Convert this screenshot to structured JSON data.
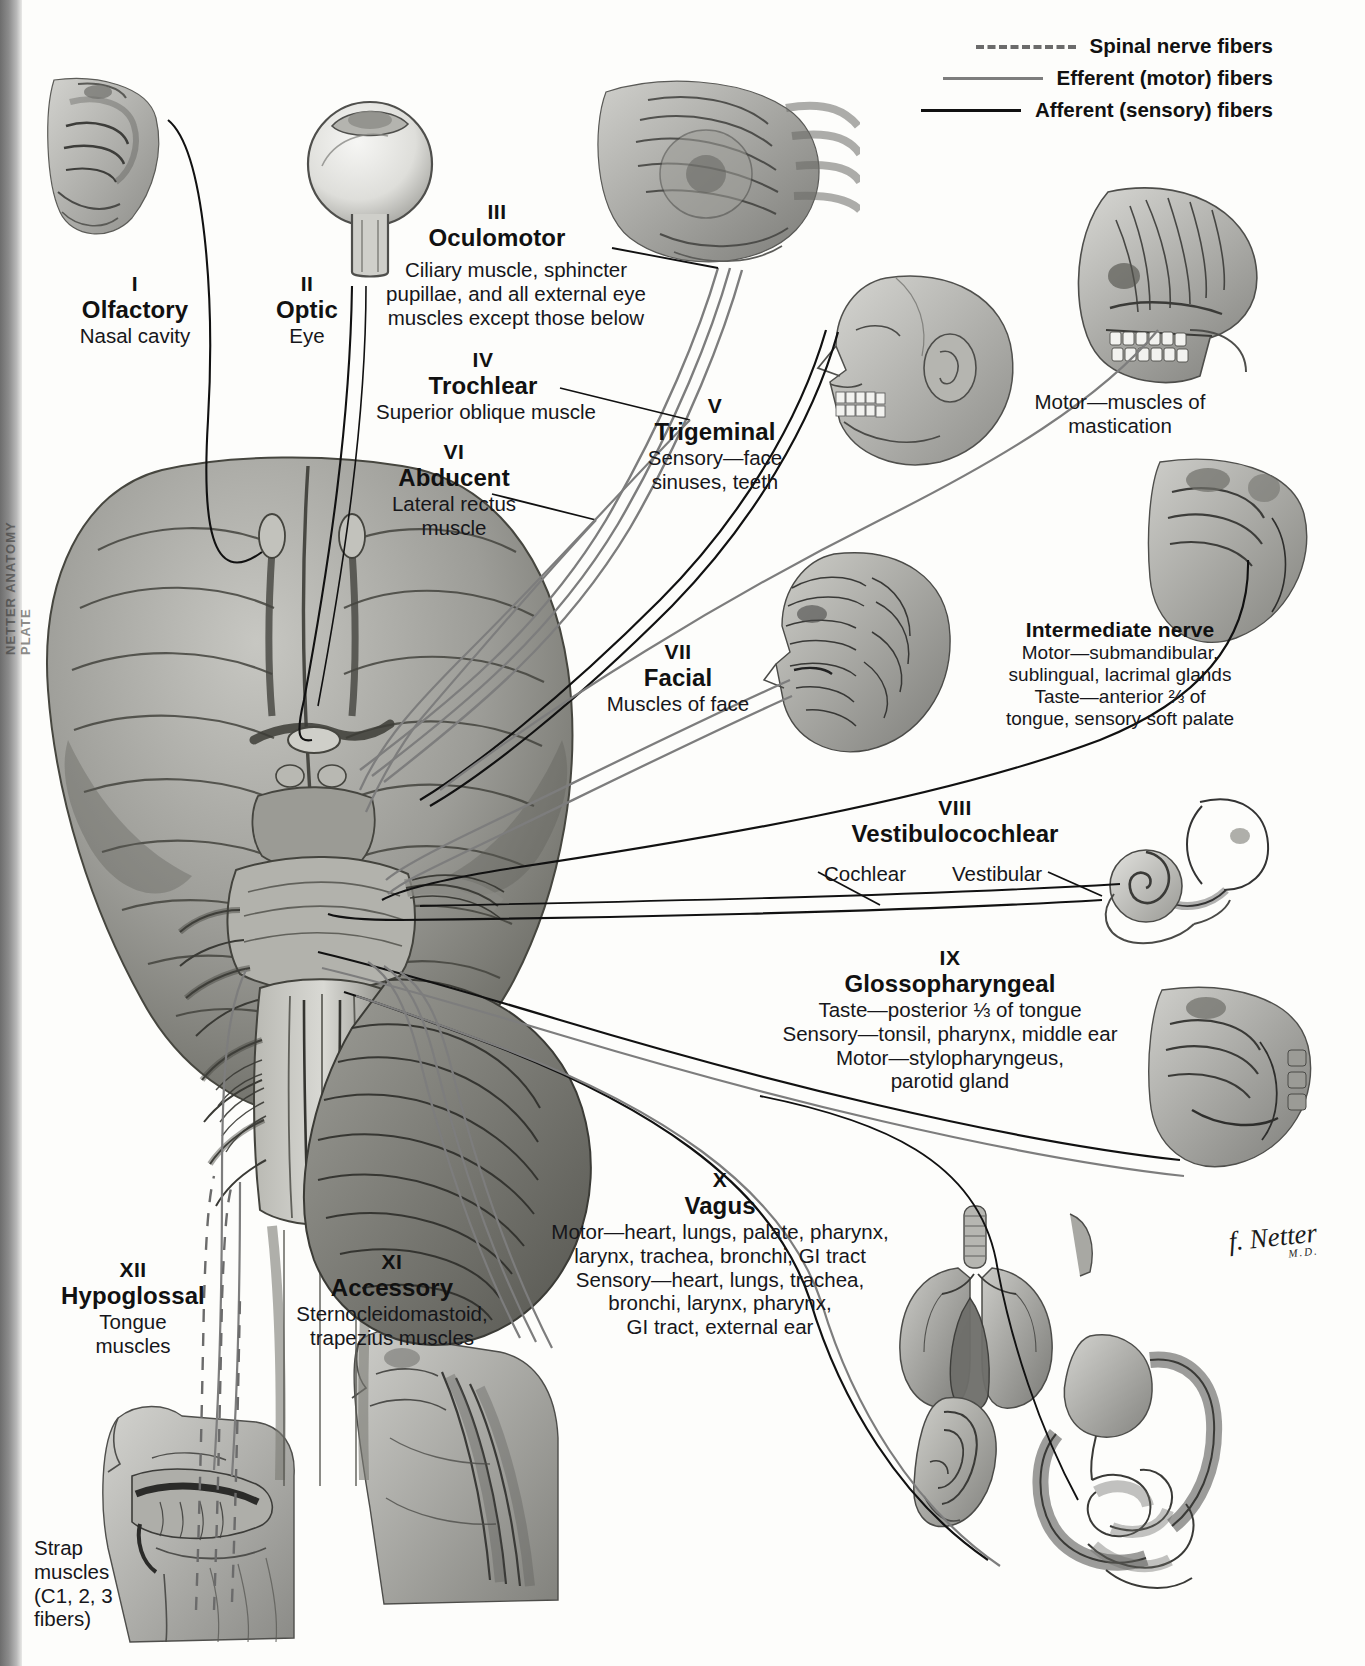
{
  "plate": {
    "margin_text": "NETTER ANATOMY PLATE"
  },
  "legend": {
    "title": "",
    "items": [
      {
        "key": "dashed",
        "label": "Spinal nerve fibers",
        "color": "#6b6b6b"
      },
      {
        "key": "solid-gray",
        "label": "Efferent (motor) fibers",
        "color": "#7d7d7d"
      },
      {
        "key": "solid-black",
        "label": "Afferent (sensory) fibers",
        "color": "#111111"
      }
    ]
  },
  "nerves": [
    {
      "numeral": "I",
      "name": "Olfactory",
      "description": "Nasal cavity",
      "extra": ""
    },
    {
      "numeral": "II",
      "name": "Optic",
      "description": "Eye",
      "extra": ""
    },
    {
      "numeral": "III",
      "name": "Oculomotor",
      "description": "Ciliary muscle, sphincter\npupillae, and all external eye\nmuscles except those below",
      "extra": ""
    },
    {
      "numeral": "IV",
      "name": "Trochlear",
      "description": "Superior oblique muscle",
      "extra": ""
    },
    {
      "numeral": "VI",
      "name": "Abducent",
      "description": "Lateral rectus\nmuscle",
      "extra": ""
    },
    {
      "numeral": "V",
      "name": "Trigeminal",
      "description": "Sensory—face\nsinuses, teeth",
      "extra": "Motor—muscles of\nmastication"
    },
    {
      "numeral": "VII",
      "name": "Facial",
      "description": "Muscles of face",
      "extra": ""
    },
    {
      "numeral": "VIII",
      "name": "Vestibulocochlear",
      "description": "",
      "extra": ""
    },
    {
      "numeral": "IX",
      "name": "Glossopharyngeal",
      "description": "Taste—posterior ⅓ of tongue\nSensory—tonsil, pharynx, middle ear\nMotor—stylopharyngeus,\nparotid gland",
      "extra": ""
    },
    {
      "numeral": "X",
      "name": "Vagus",
      "description": "Motor—heart, lungs, palate, pharynx,\nlarynx, trachea, bronchi, GI tract\nSensory—heart, lungs, trachea,\nbronchi, larynx, pharynx,\nGI tract, external ear",
      "extra": ""
    },
    {
      "numeral": "XI",
      "name": "Accessory",
      "description": "Sternocleidomastoid,\ntrapezius muscles",
      "extra": ""
    },
    {
      "numeral": "XII",
      "name": "Hypoglossal",
      "description": "Tongue\nmuscles",
      "extra": ""
    }
  ],
  "callouts": {
    "intermediate_nerve_title": "Intermediate nerve",
    "intermediate_nerve_body": "Motor—submandibular,\nsublingual, lacrimal glands\nTaste—anterior ⅔ of\ntongue, sensory soft palate",
    "cochlear": "Cochlear",
    "vestibular": "Vestibular",
    "strap_muscles": "Strap\nmuscles\n(C1, 2, 3\nfibers)"
  },
  "signature": {
    "name": "f. Netter",
    "credentials": "M.D."
  },
  "colors": {
    "afferent": "#111111",
    "efferent": "#7d7d7d",
    "spinal": "#6b6b6b",
    "tissue_light": "#c9c9c5",
    "tissue_mid": "#9a9a96",
    "tissue_dark": "#6e6e6a",
    "tissue_darker": "#4e4e4b"
  }
}
